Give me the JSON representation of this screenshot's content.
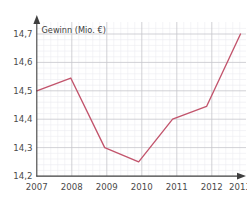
{
  "chart_data": {
    "type": "line",
    "title": "",
    "axis_title": "Gewinn (Mio. €)",
    "xlabel": "",
    "ylabel": "Gewinn (Mio. €)",
    "categories": [
      "2007",
      "2008",
      "2009",
      "2010",
      "2011",
      "2012",
      "2013"
    ],
    "x": [
      2007,
      2008,
      2009,
      2010,
      2011,
      2012,
      2013
    ],
    "values": [
      14.5,
      14.545,
      14.3,
      14.25,
      14.4,
      14.445,
      14.7
    ],
    "series": [
      {
        "name": "Gewinn",
        "values": [
          14.5,
          14.545,
          14.3,
          14.25,
          14.4,
          14.445,
          14.7
        ],
        "color": "#c2546c"
      }
    ],
    "ylim": [
      14.2,
      14.7
    ],
    "xlim": [
      2007,
      2013
    ],
    "ytick_labels": [
      "14,2",
      "14,3",
      "14,4",
      "14,5",
      "14,6",
      "14,7"
    ],
    "ytick_values": [
      14.2,
      14.3,
      14.4,
      14.5,
      14.6,
      14.7
    ],
    "xtick_labels": [
      "2007",
      "2008",
      "2009",
      "2010",
      "2011",
      "2012",
      "2013"
    ],
    "grid": true,
    "minor_grid": true,
    "legend": "none",
    "markers": false,
    "axis_arrows": true,
    "decimal_separator": ","
  },
  "colors": {
    "line": "#c2546c",
    "axis": "#3f3f3f",
    "major_grid": "#c8c8cc",
    "minor_grid": "#e9e9ee",
    "background": "#ffffff",
    "tick_text": "#4a4a4a",
    "label_text": "#3c3c3c"
  },
  "labels": {
    "y_axis_caption": "Gewinn (Mio. €)",
    "y0": "14,2",
    "y1": "14,3",
    "y2": "14,4",
    "y3": "14,5",
    "y4": "14,6",
    "y5": "14,7",
    "x0": "2007",
    "x1": "2008",
    "x2": "2009",
    "x3": "2010",
    "x4": "2011",
    "x5": "2012",
    "x6": "2013"
  }
}
